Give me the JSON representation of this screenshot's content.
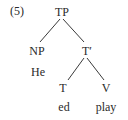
{
  "example_number": "(5)",
  "tree": {
    "root": "TP",
    "subject": {
      "label": "NP",
      "word": "He"
    },
    "t_bar": {
      "label": "T′",
      "head": {
        "label": "T",
        "word": "ed"
      },
      "complement": {
        "label": "V",
        "word": "play"
      }
    }
  }
}
